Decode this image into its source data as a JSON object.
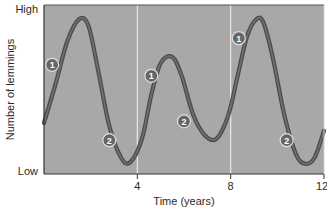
{
  "chart_data": {
    "type": "line",
    "title": "",
    "xlabel": "Time (years)",
    "ylabel": "Number of lemmings",
    "xlim": [
      0,
      12
    ],
    "ylim": [
      0,
      1
    ],
    "y_tick_labels": [
      {
        "value": 1,
        "label": "High"
      },
      {
        "value": 0,
        "label": "Low"
      }
    ],
    "x_ticks": [
      4,
      8,
      12
    ],
    "x_tick_labels": [
      "4",
      "8",
      "12"
    ],
    "vertical_gridlines": [
      4,
      8
    ],
    "grid": false,
    "legend": "none",
    "series": [
      {
        "name": "Lemming population",
        "x": [
          0,
          0.5,
          1.0,
          1.5,
          1.9,
          2.3,
          2.8,
          3.3,
          3.7,
          4.2,
          4.6,
          5.0,
          5.5,
          5.9,
          6.4,
          6.9,
          7.4,
          7.9,
          8.3,
          8.7,
          9.1,
          9.4,
          9.8,
          10.3,
          10.8,
          11.2,
          11.6,
          12
        ],
        "values": [
          0.3,
          0.55,
          0.82,
          0.96,
          0.92,
          0.65,
          0.28,
          0.08,
          0.05,
          0.2,
          0.48,
          0.68,
          0.72,
          0.6,
          0.35,
          0.22,
          0.2,
          0.35,
          0.6,
          0.85,
          0.96,
          0.94,
          0.72,
          0.35,
          0.1,
          0.04,
          0.08,
          0.25
        ]
      }
    ],
    "annotations": [
      {
        "label": "1",
        "x": 0.35,
        "y": 0.67
      },
      {
        "label": "2",
        "x": 2.8,
        "y": 0.19
      },
      {
        "label": "1",
        "x": 4.6,
        "y": 0.6
      },
      {
        "label": "2",
        "x": 6.0,
        "y": 0.31
      },
      {
        "label": "1",
        "x": 8.35,
        "y": 0.84
      },
      {
        "label": "2",
        "x": 10.4,
        "y": 0.19
      }
    ],
    "colors": {
      "plot_background": "#a8a8a8",
      "curve": "#6e6e6e",
      "curve_edge": "#4a4a4a",
      "gridline": "#e8e8e8",
      "marker_fill": "#666666",
      "marker_text": "#ffffff"
    }
  }
}
